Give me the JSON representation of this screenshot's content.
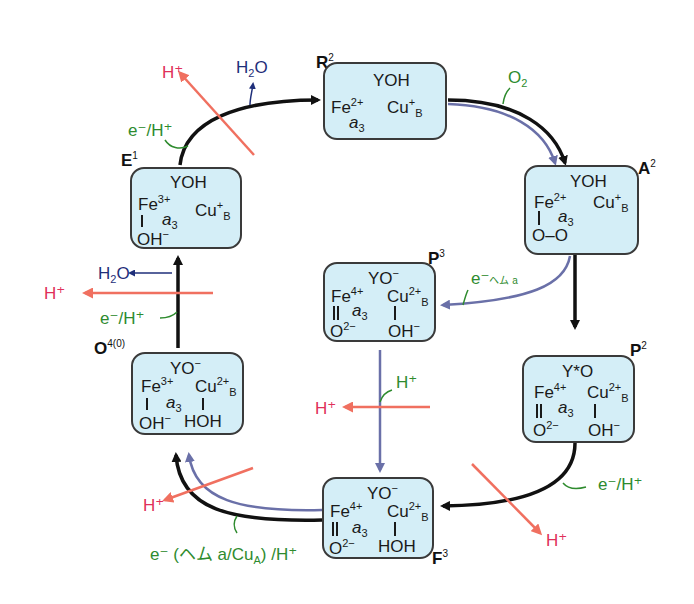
{
  "colors": {
    "box_fill": "#d4eef7",
    "box_border": "#3a3a3a",
    "main_arrow": "#111111",
    "branch_arrow": "#6a70a8",
    "proton_pump": "#f07060",
    "proton_text": "#e0305a",
    "electron_text": "#2e8b2e",
    "water_text": "#1f2f7a"
  },
  "states": {
    "R": {
      "label": "R",
      "sup": "2",
      "tyr": "YOH",
      "fe": "Fe",
      "fe_sup": "2+",
      "heme": "a",
      "heme_sub": "3",
      "cu": "Cu",
      "cu_sup": "+",
      "cu_sub": "B"
    },
    "A": {
      "label": "A",
      "sup": "2",
      "tyr": "YOH",
      "fe": "Fe",
      "fe_sup": "2+",
      "heme": "a",
      "heme_sub": "3",
      "cu": "Cu",
      "cu_sup": "+",
      "cu_sub": "B",
      "ligand": "O–O"
    },
    "P3": {
      "label": "P",
      "sup": "3",
      "tyr": "YO",
      "tyr_sup": "−",
      "fe": "Fe",
      "fe_sup": "4+",
      "heme": "a",
      "heme_sub": "3",
      "cu": "Cu",
      "cu_sup": "2+",
      "cu_sub": "B",
      "fe_ligand": "O",
      "fe_ligand_sup": "2−",
      "cu_ligand": "OH",
      "cu_ligand_sup": "−"
    },
    "P2": {
      "label": "P",
      "sup": "2",
      "tyr": "Y*O",
      "fe": "Fe",
      "fe_sup": "4+",
      "heme": "a",
      "heme_sub": "3",
      "cu": "Cu",
      "cu_sup": "2+",
      "cu_sub": "B",
      "fe_ligand": "O",
      "fe_ligand_sup": "2−",
      "cu_ligand": "OH",
      "cu_ligand_sup": "−"
    },
    "F": {
      "label": "F",
      "sup": "3",
      "tyr": "YO",
      "tyr_sup": "−",
      "fe": "Fe",
      "fe_sup": "4+",
      "heme": "a",
      "heme_sub": "3",
      "cu": "Cu",
      "cu_sup": "2+",
      "cu_sub": "B",
      "fe_ligand": "O",
      "fe_ligand_sup": "2−",
      "cu_ligand": "HOH"
    },
    "O": {
      "label": "O",
      "sup": "4(0)",
      "tyr": "YO",
      "tyr_sup": "−",
      "fe": "Fe",
      "fe_sup": "3+",
      "heme": "a",
      "heme_sub": "3",
      "cu": "Cu",
      "cu_sup": "2+",
      "cu_sub": "B",
      "fe_ligand": "OH",
      "fe_ligand_sup": "−",
      "cu_ligand": "HOH"
    },
    "E": {
      "label": "E",
      "sup": "1",
      "tyr": "YOH",
      "fe": "Fe",
      "fe_sup": "3+",
      "heme": "a",
      "heme_sub": "3",
      "cu": "Cu",
      "cu_sup": "+",
      "cu_sub": "B",
      "fe_ligand": "OH",
      "fe_ligand_sup": "−"
    }
  },
  "annotations": {
    "o2": {
      "text": "O",
      "sub": "2"
    },
    "e_h": "e⁻/H⁺",
    "h_plus": "H⁺",
    "h2o": {
      "text": "H",
      "sub": "2",
      "after": "O"
    },
    "e_heme_a": "e⁻",
    "heme_a_small": "ヘム a",
    "h_plus_green": "H⁺",
    "e_heme_cu": "e⁻ (ヘム a/Cu",
    "e_heme_cu_sub": "A",
    "e_heme_cu_end": ") /H⁺"
  }
}
